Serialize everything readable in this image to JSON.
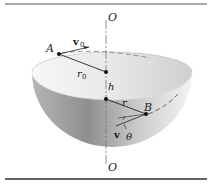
{
  "figure": {
    "axis_top_label": "O",
    "axis_bottom_label": "O",
    "point_a_label": "A",
    "point_b_label": "B",
    "velocity_a_label": "v",
    "velocity_a_subscript": "0",
    "radius_a_label": "r",
    "radius_a_subscript": "0",
    "height_label": "h",
    "radius_b_label": "r",
    "velocity_b_label": "v",
    "angle_label": "θ"
  },
  "colors": {
    "rule": "#333333",
    "ink": "#1a1a1a",
    "bowl_light": "#f2f2f2",
    "bowl_dark": "#9a9a9a"
  }
}
